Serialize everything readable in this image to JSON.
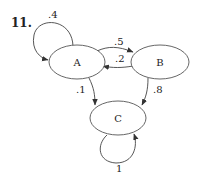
{
  "problem_number": "11.",
  "diagram": {
    "type": "markov-chain",
    "nodes": [
      {
        "id": "A",
        "label": "A"
      },
      {
        "id": "B",
        "label": "B"
      },
      {
        "id": "C",
        "label": "C"
      }
    ],
    "edges": [
      {
        "from": "A",
        "to": "A",
        "label": ".4"
      },
      {
        "from": "A",
        "to": "B",
        "label": ".5"
      },
      {
        "from": "B",
        "to": "A",
        "label": ".2"
      },
      {
        "from": "A",
        "to": "C",
        "label": ".1"
      },
      {
        "from": "B",
        "to": "C",
        "label": ".8"
      },
      {
        "from": "C",
        "to": "C",
        "label": "1"
      }
    ]
  },
  "colors": {
    "stroke": "#555555",
    "text": "#222222",
    "background": "#ffffff"
  }
}
